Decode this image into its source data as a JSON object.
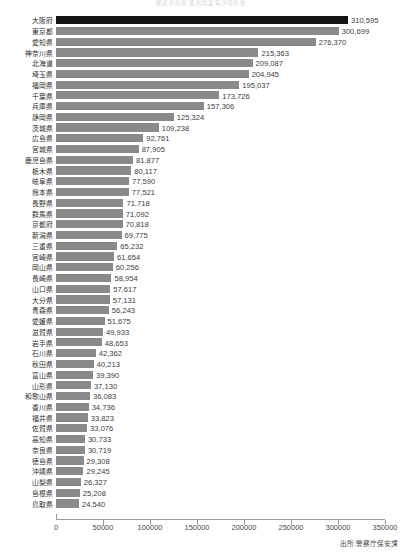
{
  "chart_data": {
    "type": "bar",
    "orientation": "horizontal",
    "title": "都道府県別 風俗営業等許可件数",
    "xlabel": "",
    "ylabel": "",
    "xlim": [
      0,
      350000
    ],
    "grid": false,
    "legend": "none",
    "source_note": "出所:警察庁保安課",
    "tick_labels": [
      "0",
      "50000",
      "100000",
      "150000",
      "200000",
      "250000",
      "300000",
      "350000"
    ],
    "tick_values": [
      0,
      50000,
      100000,
      150000,
      200000,
      250000,
      300000,
      350000
    ],
    "colors": {
      "bar": "#8a8a8a",
      "highlight_bar": "#141414",
      "axis": "#9a9a9a",
      "text": "#3c3c3c"
    },
    "highlight_index": 0,
    "categories": [
      "大阪府",
      "東京都",
      "愛知県",
      "神奈川県",
      "北海道",
      "埼玉県",
      "福岡県",
      "千葉県",
      "兵庫県",
      "静岡県",
      "茨城県",
      "広島県",
      "宮城県",
      "鹿児島県",
      "栃木県",
      "岐阜県",
      "熊本県",
      "長野県",
      "群馬県",
      "京都府",
      "新潟県",
      "三重県",
      "宮崎県",
      "岡山県",
      "長崎県",
      "山口県",
      "大分県",
      "青森県",
      "愛媛県",
      "滋賀県",
      "岩手県",
      "石川県",
      "秋田県",
      "富山県",
      "山形県",
      "和歌山県",
      "香川県",
      "福井県",
      "佐賀県",
      "高知県",
      "奈良県",
      "徳島県",
      "沖縄県",
      "山梨県",
      "島根県",
      "鳥取県"
    ],
    "values": [
      310595,
      300699,
      276370,
      215363,
      209087,
      204945,
      195037,
      173726,
      157306,
      125324,
      109238,
      92761,
      87905,
      81877,
      80117,
      77590,
      77521,
      71718,
      71092,
      70818,
      69775,
      65232,
      61654,
      60256,
      58954,
      57617,
      57131,
      56243,
      51675,
      49933,
      48653,
      42362,
      40213,
      39390,
      37130,
      36083,
      34736,
      33823,
      33076,
      30733,
      30719,
      29308,
      29245,
      26327,
      25208,
      24540
    ],
    "value_labels": [
      "310,595",
      "300,699",
      "276,370",
      "215,363",
      "209,087",
      "204,945",
      "195,037",
      "173,726",
      "157,306",
      "125,324",
      "109,238",
      "92,761",
      "87,905",
      "81,877",
      "80,117",
      "77,590",
      "77,521",
      "71,718",
      "71,092",
      "70,818",
      "69,775",
      "65,232",
      "61,654",
      "60,256",
      "58,954",
      "57,617",
      "57,131",
      "56,243",
      "51,675",
      "49,933",
      "48,653",
      "42,362",
      "40,213",
      "39,390",
      "37,130",
      "36,083",
      "34,736",
      "33,823",
      "33,076",
      "30,733",
      "30,719",
      "29,308",
      "29,245",
      "26,327",
      "25,208",
      "24,540"
    ]
  }
}
